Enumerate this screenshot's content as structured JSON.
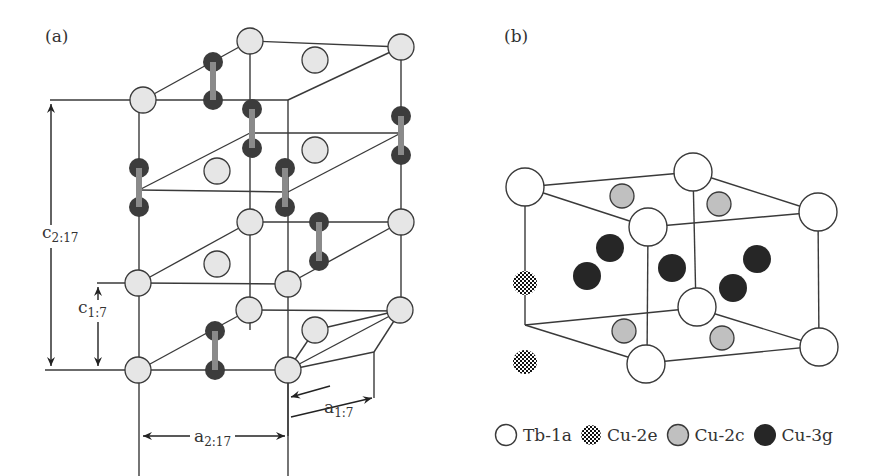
{
  "panels": {
    "a": {
      "label": "(a)"
    },
    "b": {
      "label": "(b)"
    }
  },
  "dimensions": {
    "c_2_17": {
      "base": "c",
      "sub": "2:17"
    },
    "c_1_7": {
      "base": "c",
      "sub": "1:7"
    },
    "a_2_17": {
      "base": "a",
      "sub": "2:17"
    },
    "a_1_7": {
      "base": "a",
      "sub": "1:7"
    }
  },
  "legend": [
    {
      "symbol": "open-circle",
      "label": "Tb-1a"
    },
    {
      "symbol": "checkered-circle",
      "label": "Cu-2e"
    },
    {
      "symbol": "gray-circle",
      "label": "Cu-2c"
    },
    {
      "symbol": "black-circle",
      "label": "Cu-3g"
    }
  ],
  "colors": {
    "line": "#3a3a3a",
    "light_atom": "#e6e6e6",
    "dark_atom": "#3c3c3c",
    "dumbbell_bar": "#8a8a8a",
    "cu2c": "#c0c0c0",
    "cu3g": "#222222"
  }
}
